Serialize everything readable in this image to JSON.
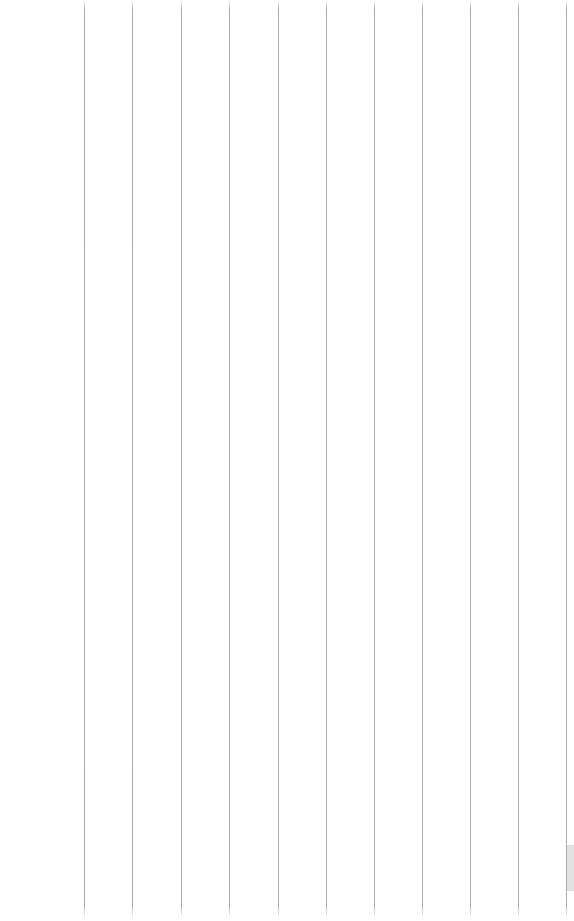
{
  "page": {
    "background_color": "#ffffff",
    "width_px": 574,
    "height_px": 921,
    "body_text": "",
    "content_note": "empty"
  },
  "grid": {
    "orientation": "vertical",
    "line_color": "#9b9b9b",
    "line_width_px": 1,
    "line_count": 11,
    "spacing_px": 48.3,
    "top_y_px": 0,
    "bottom_y_px": 916,
    "left_margin_px": 84,
    "lines": [
      {
        "id": "gridline-1",
        "x": 84,
        "label": ""
      },
      {
        "id": "gridline-2",
        "x": 132,
        "label": ""
      },
      {
        "id": "gridline-3",
        "x": 181,
        "label": ""
      },
      {
        "id": "gridline-4",
        "x": 229,
        "label": ""
      },
      {
        "id": "gridline-5",
        "x": 278,
        "label": ""
      },
      {
        "id": "gridline-6",
        "x": 326,
        "label": ""
      },
      {
        "id": "gridline-7",
        "x": 374,
        "label": ""
      },
      {
        "id": "gridline-8",
        "x": 422,
        "label": ""
      },
      {
        "id": "gridline-9",
        "x": 470,
        "label": ""
      },
      {
        "id": "gridline-10",
        "x": 518,
        "label": ""
      },
      {
        "id": "gridline-11",
        "x": 566,
        "label": ""
      }
    ]
  },
  "margin": {
    "label": "",
    "width_px": 84,
    "background_color": "#ffffff"
  },
  "scrollbar": {
    "color": "#c9c9c9",
    "width_px": 7,
    "thumb_top_px": 845,
    "thumb_height_px": 46,
    "label": ""
  }
}
